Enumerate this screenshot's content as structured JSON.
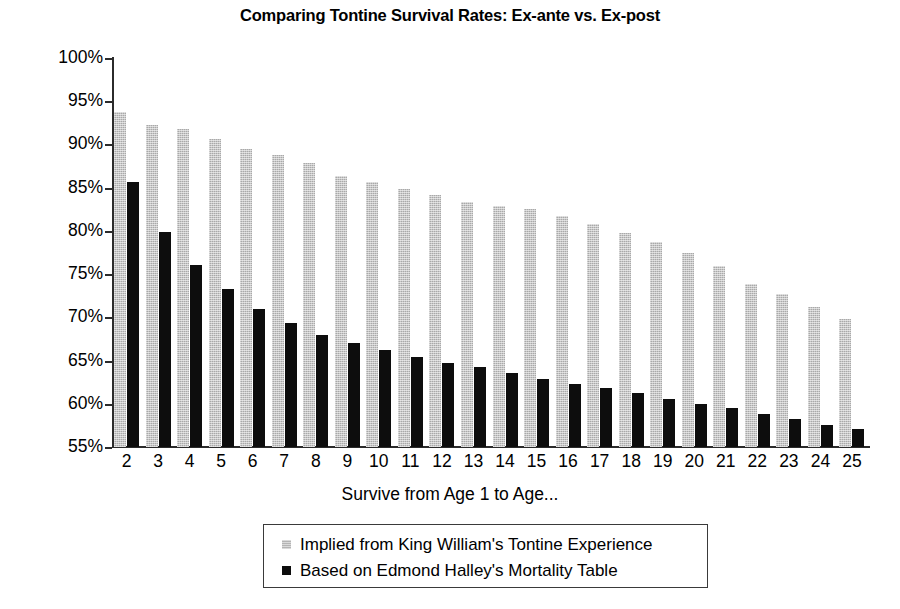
{
  "chart_data": {
    "type": "bar",
    "title": "Comparing Tontine Survival Rates: Ex-ante vs. Ex-post",
    "xlabel": "Survive from Age 1 to Age...",
    "ylabel": "Probability",
    "ylim": [
      55,
      100
    ],
    "ytick_labels": [
      "100%",
      "95%",
      "90%",
      "85%",
      "80%",
      "75%",
      "70%",
      "65%",
      "60%",
      "55%"
    ],
    "ytick_values": [
      100,
      95,
      90,
      85,
      80,
      75,
      70,
      65,
      60,
      55
    ],
    "grid": false,
    "legend_position": "below-plot",
    "categories": [
      "2",
      "3",
      "4",
      "5",
      "6",
      "7",
      "8",
      "9",
      "10",
      "11",
      "12",
      "13",
      "14",
      "15",
      "16",
      "17",
      "18",
      "19",
      "20",
      "21",
      "22",
      "23",
      "24",
      "25"
    ],
    "series": [
      {
        "name": "Implied from King William's Tontine Experience",
        "color": "#a9a9a9",
        "values": [
          93.8,
          92.3,
          91.8,
          90.6,
          89.5,
          88.8,
          87.8,
          86.3,
          85.6,
          84.9,
          84.2,
          83.4,
          82.9,
          82.5,
          81.7,
          80.8,
          79.8,
          78.7,
          77.4,
          75.9,
          73.9,
          72.7,
          71.2,
          69.8
        ]
      },
      {
        "name": "Based on Edmond Halley's Mortality Table",
        "color": "#0d0d0d",
        "values": [
          85.6,
          79.9,
          76.1,
          73.3,
          71.0,
          69.3,
          68.0,
          67.0,
          66.2,
          65.4,
          64.7,
          64.2,
          63.6,
          62.9,
          62.3,
          61.8,
          61.2,
          60.6,
          60.0,
          59.5,
          58.8,
          58.2,
          57.5,
          57.1
        ]
      }
    ]
  },
  "legend": {
    "items": [
      {
        "label": "Implied from King William's Tontine Experience",
        "swatch": "ex-ante"
      },
      {
        "label": "Based on Edmond Halley's Mortality Table",
        "swatch": "ex-post"
      }
    ]
  }
}
